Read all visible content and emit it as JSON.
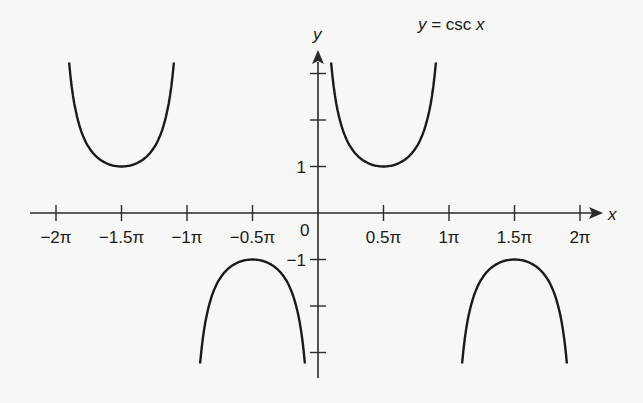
{
  "chart_data": {
    "type": "line",
    "title": "y = csc x",
    "title_parts": {
      "y": "y",
      "eq": " = csc ",
      "x": "x"
    },
    "xlabel": "x",
    "ylabel": "y",
    "xlim": [
      -6.6,
      6.9
    ],
    "ylim": [
      -3.4,
      3.4
    ],
    "grid": false,
    "legend": "none",
    "x_tick_labels": [
      "−2π",
      "−1.5π",
      "−1π",
      "−0.5π",
      "0.5π",
      "1π",
      "1.5π",
      "2π"
    ],
    "x_tick_values_pi": [
      -2,
      -1.5,
      -1,
      -0.5,
      0.5,
      1,
      1.5,
      2
    ],
    "origin_label": "0",
    "y_tick_labels": [
      "1",
      "−1"
    ],
    "y_tick_values": [
      -3,
      -2,
      -1,
      1,
      2,
      3
    ],
    "series": [
      {
        "name": "csc x, (−2π, −π)",
        "x_range_pi": [
          -1.9,
          -1.1
        ],
        "vertex": {
          "x_pi": -1.5,
          "y": 1
        }
      },
      {
        "name": "csc x, (−π, 0)",
        "x_range_pi": [
          -0.9,
          -0.1
        ],
        "vertex": {
          "x_pi": -0.5,
          "y": -1
        }
      },
      {
        "name": "csc x, (0, π)",
        "x_range_pi": [
          0.1,
          0.9
        ],
        "vertex": {
          "x_pi": 0.5,
          "y": 1
        }
      },
      {
        "name": "csc x, (π, 2π)",
        "x_range_pi": [
          1.1,
          1.9
        ],
        "vertex": {
          "x_pi": 1.5,
          "y": -1
        }
      }
    ]
  },
  "colors": {
    "curve": "#1a1a1a",
    "axis": "#2a2a2a",
    "background": "#f7f7f5"
  }
}
